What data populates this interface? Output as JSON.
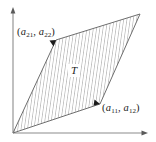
{
  "figure": {
    "background_color": "#ffffff",
    "axis_color": "#8c8c8c",
    "outline_color": "#6e6e6e",
    "hatch_color": "#9a9a9a",
    "text_color": "#1a1a1a",
    "axes": {
      "x_axis_name": "x-axis",
      "y_axis_name": "y-axis",
      "origin_x": 13,
      "origin_y": 133,
      "x_axis_end": 147,
      "y_axis_top": 8,
      "arrowheads": "both-axes"
    },
    "region": {
      "label": "T",
      "fill": "diagonal-hatch",
      "vertices": [
        {
          "name": "origin",
          "x": 13,
          "y": 133
        },
        {
          "name": "a11-a12-vertex",
          "x": 100,
          "y": 104
        },
        {
          "name": "sum-vertex",
          "x": 140,
          "y": 14
        },
        {
          "name": "a21-a22-vertex",
          "x": 56,
          "y": 40
        }
      ]
    },
    "labels": {
      "vector1": {
        "name": "a11-a12-label",
        "open_paren": "(",
        "base1": "a",
        "sub1": "11",
        "comma": ",",
        "base2": "a",
        "sub2": "12",
        "close_paren": ")",
        "pointer": "arrowhead",
        "pointer_target_x": 100,
        "pointer_target_y": 104
      },
      "vector2": {
        "name": "a21-a22-label",
        "open_paren": "(",
        "base1": "a",
        "sub1": "21",
        "comma": ",",
        "base2": "a",
        "sub2": "22",
        "close_paren": ")",
        "pointer": "arrowhead",
        "pointer_target_x": 56,
        "pointer_target_y": 40
      }
    }
  }
}
